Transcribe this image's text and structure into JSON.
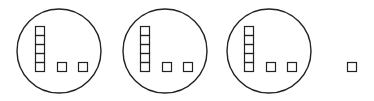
{
  "diagram": {
    "stroke_color": "#222222",
    "background": "#ffffff",
    "groups": [
      {
        "circle": {
          "cx": 59,
          "cy": 51,
          "r": 42
        },
        "stack_x": 35,
        "singles_x": [
          57,
          78
        ]
      },
      {
        "circle": {
          "cx": 165,
          "cy": 51,
          "r": 42
        },
        "stack_x": 140,
        "singles_x": [
          162,
          183
        ]
      },
      {
        "circle": {
          "cx": 269,
          "cy": 51,
          "r": 42
        },
        "stack_x": 244,
        "singles_x": [
          266,
          287
        ]
      }
    ],
    "stack_count": 5,
    "square_size": 9,
    "stack_top_y": 26,
    "singles_y": 62,
    "lone_square": {
      "x": 347,
      "y": 62
    }
  }
}
